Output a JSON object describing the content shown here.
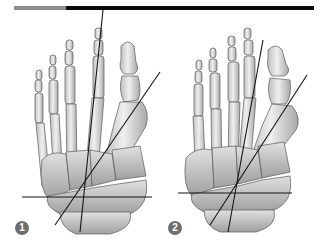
{
  "header_bar": {
    "accent_color": "#8c8c8c",
    "main_color": "#0a0a0a"
  },
  "figures": [
    {
      "id": "panel-1",
      "label": "1",
      "subject": "dorsal view of foot skeleton with metatarsal axis lines (normal alignment)",
      "axis_lines": [
        {
          "name": "second-metatarsal-axis",
          "x1": 103,
          "y1": 10,
          "x2": 80,
          "y2": 232
        },
        {
          "name": "first-metatarsal-axis",
          "x1": 160,
          "y1": 72,
          "x2": 55,
          "y2": 225
        },
        {
          "name": "transverse-tarsal-line",
          "x1": 22,
          "y1": 197,
          "x2": 152,
          "y2": 197
        }
      ]
    },
    {
      "id": "panel-2",
      "label": "2",
      "subject": "dorsal view of foot skeleton with metatarsal axis lines (metatarsus varus / hallux valgus)",
      "axis_lines": [
        {
          "name": "second-metatarsal-axis",
          "x1": 263,
          "y1": 40,
          "x2": 228,
          "y2": 232
        },
        {
          "name": "first-metatarsal-axis",
          "x1": 307,
          "y1": 75,
          "x2": 210,
          "y2": 225
        },
        {
          "name": "transverse-tarsal-line",
          "x1": 178,
          "y1": 193,
          "x2": 292,
          "y2": 193
        }
      ]
    }
  ],
  "colors": {
    "bone_fill": "#e6e6e6",
    "bone_shade": "#b4b4b4",
    "bone_outline": "#5a5a5a",
    "axis_line": "#141414",
    "badge_fill": "#6e6e6e"
  }
}
